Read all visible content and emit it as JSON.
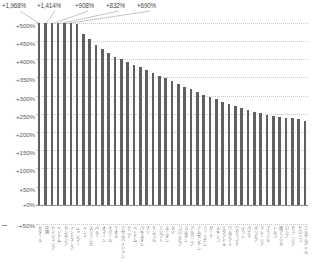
{
  "chart_data": {
    "type": "bar",
    "title": "",
    "xlabel": "",
    "ylabel": "",
    "ylim": [
      -50,
      500
    ],
    "ytick_step": 50,
    "grid": true,
    "legend": "none",
    "bar_color": "#606060",
    "axis_color": "#8c8c8c",
    "grid_color": "#c9c9c9",
    "value_suffix": "%",
    "clipped_at": 500,
    "yticks": [
      "+500%",
      "+450%",
      "+400%",
      "+350%",
      "+300%",
      "+250%",
      "+200%",
      "+150%",
      "+100%",
      "+50%",
      "+0%"
    ],
    "below_axis_tick": "-+50%",
    "annotations": [
      {
        "index": 0,
        "label": "+1,968%"
      },
      {
        "index": 1,
        "label": "+1,414%"
      },
      {
        "index": 2,
        "label": "+908%"
      },
      {
        "index": 3,
        "label": "+832%"
      },
      {
        "index": 4,
        "label": "+690%"
      }
    ],
    "categories": [
      "カタール",
      "中国",
      "ナイジェリア",
      "ベトナム",
      "カンボジア",
      "インドネシア",
      "ミャンマー",
      "インド",
      "スリランカ",
      "ペルー",
      "オマーン",
      "ネパール",
      "ラオス",
      "アゼルバイジャン",
      "ケニア",
      "ベトナム",
      "パキスタン",
      "チリ",
      "モンゴル",
      "エジプト",
      "スーダン",
      "タイ",
      "コロンビア",
      "ヨルダン",
      "アルバニア",
      "アルゼンチン",
      "フィリピン",
      "ガーナ",
      "メキシコ",
      "エクアドル",
      "ウルグアイ",
      "ウクライナ",
      "イラン",
      "パナマ",
      "ボリビア",
      "マレーシア",
      "ブラジル",
      "トルコ",
      "南アフリカ",
      "ロシア",
      "チュニジア",
      "モロッコ",
      "エルサルバドル"
    ],
    "values": [
      1968,
      1414,
      908,
      832,
      690,
      520,
      498,
      470,
      455,
      440,
      428,
      418,
      408,
      400,
      392,
      385,
      378,
      370,
      362,
      355,
      348,
      340,
      332,
      325,
      318,
      310,
      302,
      296,
      290,
      284,
      278,
      272,
      266,
      260,
      256,
      252,
      248,
      245,
      242,
      240,
      238,
      236,
      230
    ]
  }
}
